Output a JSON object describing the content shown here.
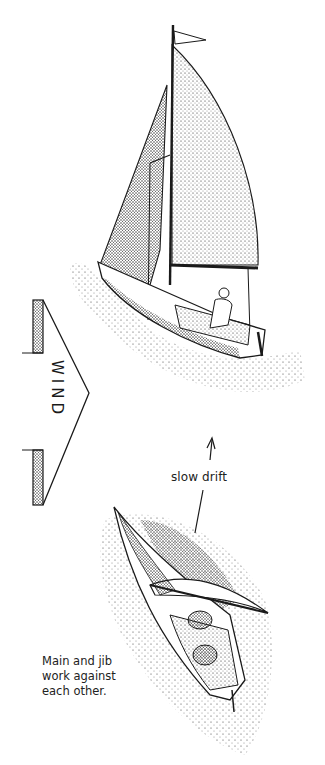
{
  "figure": {
    "type": "instructional illustration",
    "wind_arrow": {
      "label": "WIND",
      "direction": "points right"
    },
    "drift_annotation": {
      "label": "slow drift",
      "arrow": "points up"
    },
    "caption": {
      "lines": [
        "Main and jib",
        "work against",
        "each other."
      ]
    },
    "boats": [
      {
        "name": "upper-boat",
        "description": "sloop sailing with sails set, one crew at helm"
      },
      {
        "name": "lower-boat",
        "description": "boat viewed from above, sails luffing, two crew in cockpit"
      }
    ],
    "colors": {
      "ink": "#1a1a1a",
      "paper": "#ffffff"
    }
  }
}
